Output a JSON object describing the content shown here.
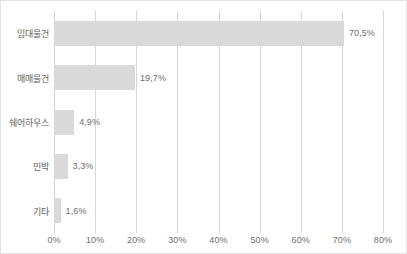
{
  "chart_data": {
    "type": "bar",
    "orientation": "horizontal",
    "title": "",
    "subtitle": "",
    "xlabel": "",
    "ylabel": "",
    "categories": [
      "임대물건",
      "매매물건",
      "쉐어하우스",
      "민박",
      "기타"
    ],
    "values": [
      70.5,
      19.7,
      4.9,
      3.3,
      1.6
    ],
    "data_labels": [
      "70,5%",
      "19,7%",
      "4,9%",
      "3,3%",
      "1,6%"
    ],
    "xlim": [
      0,
      80
    ],
    "x_ticks": [
      0,
      10,
      20,
      30,
      40,
      50,
      60,
      70,
      80
    ],
    "x_tick_labels": [
      "0%",
      "10%",
      "20%",
      "30%",
      "40%",
      "50%",
      "60%",
      "70%",
      "80%"
    ],
    "grid": "vertical",
    "legend": null,
    "bar_color": "#d9d9d9",
    "gridline_color": "#d6d6d6",
    "text_color": "#6e6e6e",
    "background_color": "#ffffff",
    "border_color": "#e3e3e3"
  }
}
